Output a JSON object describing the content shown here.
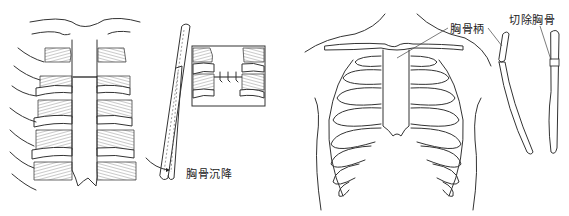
{
  "figure": {
    "left_panel": {
      "description": "Sternal depression repair – split sternum with wire sutures and lateral view",
      "labels": {
        "sternal_depression": "胸骨沉降"
      }
    },
    "right_panel": {
      "description": "Anterior view of rib cage with manubrium and lateral views of sternum",
      "labels": {
        "manubrium": "胸骨柄",
        "resected_sternum": "切除胸骨"
      }
    },
    "colors": {
      "line": "#333333",
      "background": "#ffffff"
    }
  }
}
